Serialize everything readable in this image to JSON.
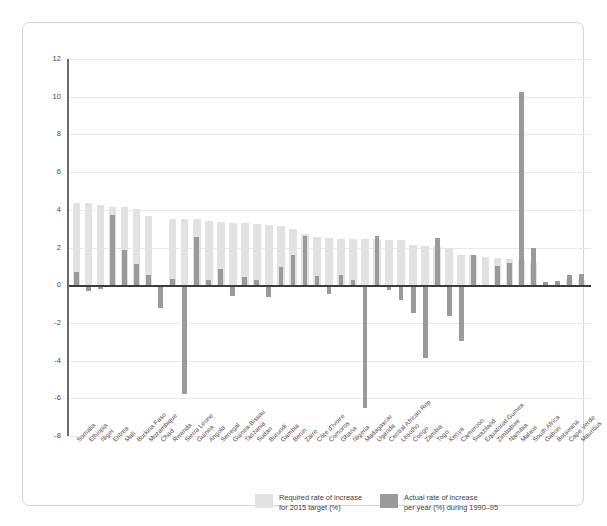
{
  "chart_data": {
    "type": "bar",
    "title": "",
    "subtitle": "",
    "xlabel": "",
    "ylabel": "",
    "ylim": [
      -8,
      12
    ],
    "yticks": [
      12,
      10,
      8,
      6,
      4,
      2,
      0,
      -2,
      -4,
      -6,
      -8
    ],
    "ytick_labels": [
      "12",
      "10",
      "8",
      "6",
      "4",
      "2",
      "0",
      "-2",
      "-4",
      "-6",
      "-8"
    ],
    "grid": true,
    "zero_line": true,
    "legend_position": "bottom",
    "bar_style": "overlaid",
    "colors": {
      "required": "#e2e2e2",
      "actual": "#9a9a9a",
      "zero_line": "#3c3c3c",
      "gridline": "#e9e9e9",
      "axis": "#6a6a6a",
      "frame": "#d8d8d8",
      "background": "#ffffff",
      "text": "#4a4a4a"
    },
    "categories": [
      "Somalia",
      "Ethiopia",
      "Niger",
      "Eritrea",
      "Mali",
      "Burkina Faso",
      "Mozambique",
      "Chad",
      "Rwanda",
      "Sierra Leone",
      "Guinea",
      "Angola",
      "Senegal",
      "Guinea-Bissau",
      "Tanzania",
      "Sudan",
      "Burundi",
      "Gambia",
      "Benin",
      "Zaire",
      "Côte d'Ivoire",
      "Comoros",
      "Ghana",
      "Nigeria",
      "Madagascar",
      "Uganda",
      "Central African Rep",
      "Lesotho",
      "Congo",
      "Zambia",
      "Togo",
      "Kenya",
      "Cameroon",
      "Swaziland",
      "Equatorial Guinea",
      "Zimbabwe",
      "Namibia",
      "Malawi",
      "South Africa",
      "Gabon",
      "Botswana",
      "Cape Verde",
      "Mauritius"
    ],
    "series": [
      {
        "name": "Required rate of increase for 2015 target (%)",
        "key": "required",
        "values": [
          4.35,
          4.35,
          4.25,
          4.15,
          4.15,
          4.05,
          3.65,
          0.0,
          3.5,
          3.5,
          3.5,
          3.4,
          3.35,
          3.3,
          3.3,
          3.25,
          3.2,
          3.15,
          3.0,
          2.7,
          2.55,
          2.5,
          2.45,
          2.45,
          2.45,
          2.45,
          2.4,
          2.4,
          2.15,
          2.1,
          2.05,
          2.0,
          1.6,
          1.6,
          1.5,
          1.45,
          1.4,
          1.35,
          1.2,
          0.0,
          0.0,
          0.35,
          0.3
        ]
      },
      {
        "name": "Actual rate of increase per year (%) during 1990–95",
        "key": "actual",
        "values": [
          0.7,
          -0.3,
          -0.2,
          3.75,
          1.85,
          1.15,
          0.55,
          -1.2,
          0.35,
          -5.75,
          2.55,
          0.25,
          0.85,
          -0.6,
          0.45,
          0.3,
          -0.65,
          0.95,
          1.6,
          2.6,
          0.5,
          -0.45,
          0.55,
          0.3,
          -6.5,
          2.6,
          -0.25,
          -0.8,
          -1.5,
          -3.85,
          2.5,
          -1.65,
          -2.95,
          1.6,
          0.0,
          1.0,
          1.2,
          10.25,
          1.95,
          0.15,
          0.2,
          0.55,
          0.6
        ]
      }
    ]
  },
  "legend": {
    "items": [
      {
        "swatch": "required",
        "line1": "Required rate of increase",
        "line2": "for 2015 target (%)"
      },
      {
        "swatch": "actual",
        "line1": "Actual rate of increase",
        "line2": "per year (%) during 1990–95"
      }
    ]
  }
}
